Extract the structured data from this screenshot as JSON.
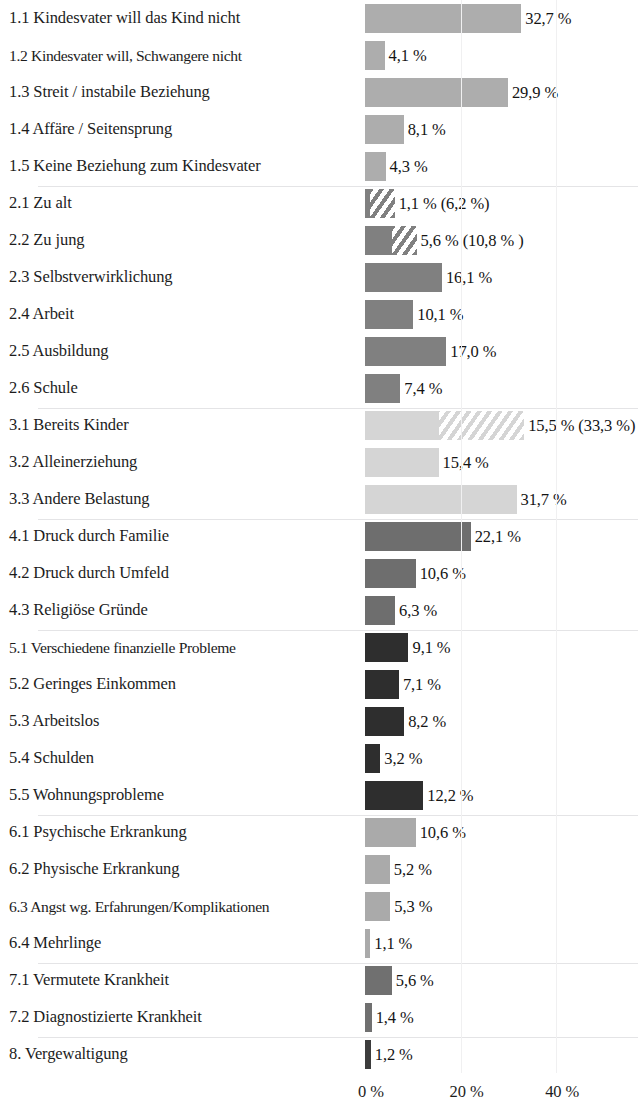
{
  "chart_data": {
    "type": "bar",
    "orientation": "horizontal",
    "title": "",
    "subtitle": "",
    "xlabel": "",
    "ylabel": "",
    "xlim": [
      0,
      45
    ],
    "grid": false,
    "legend": null,
    "xticks": [
      "0 %",
      "20 %",
      "40 %"
    ],
    "xtick_values": [
      0,
      20,
      40
    ],
    "value_separator": ",",
    "unit": "%",
    "note_parenthetical_meaning": "hatched extension / value in parentheses",
    "groups": [
      {
        "id": "1",
        "color": "#adadad",
        "items": [
          {
            "label": "1.1 Kindesvater will das Kind nicht",
            "value": 32.7,
            "value_label": "32,7 %",
            "hatch_value": null,
            "hatch_label": null
          },
          {
            "label": "1.2 Kindesvater will, Schwangere nicht",
            "value": 4.1,
            "value_label": "4,1 %",
            "hatch_value": null,
            "hatch_label": null
          },
          {
            "label": "1.3 Streit / instabile Beziehung",
            "value": 29.9,
            "value_label": "29,9 %",
            "hatch_value": null,
            "hatch_label": null
          },
          {
            "label": "1.4 Affäre / Seitensprung",
            "value": 8.1,
            "value_label": "8,1 %",
            "hatch_value": null,
            "hatch_label": null
          },
          {
            "label": "1.5 Keine Beziehung zum Kindesvater",
            "value": 4.3,
            "value_label": "4,3 %",
            "hatch_value": null,
            "hatch_label": null
          }
        ]
      },
      {
        "id": "2",
        "color": "#808080",
        "items": [
          {
            "label": "2.1 Zu alt",
            "value": 1.1,
            "value_label": "1,1 % (6,2 %)",
            "hatch_value": 6.2,
            "hatch_label": "6,2 %"
          },
          {
            "label": "2.2 Zu jung",
            "value": 5.6,
            "value_label": "5,6 % (10,8 % )",
            "hatch_value": 10.8,
            "hatch_label": "10,8 %"
          },
          {
            "label": "2.3 Selbstverwirklichung",
            "value": 16.1,
            "value_label": "16,1 %",
            "hatch_value": null,
            "hatch_label": null
          },
          {
            "label": "2.4 Arbeit",
            "value": 10.1,
            "value_label": "10,1 %",
            "hatch_value": null,
            "hatch_label": null
          },
          {
            "label": "2.5 Ausbildung",
            "value": 17.0,
            "value_label": "17,0 %",
            "hatch_value": null,
            "hatch_label": null
          },
          {
            "label": "2.6 Schule",
            "value": 7.4,
            "value_label": "7,4 %",
            "hatch_value": null,
            "hatch_label": null
          }
        ]
      },
      {
        "id": "3",
        "color": "#d5d5d5",
        "items": [
          {
            "label": "3.1 Bereits Kinder",
            "value": 15.5,
            "value_label": "15,5 % (33,3 %)",
            "hatch_value": 33.3,
            "hatch_label": "33,3 %"
          },
          {
            "label": "3.2 Alleinerziehung",
            "value": 15.4,
            "value_label": "15,4 %",
            "hatch_value": null,
            "hatch_label": null
          },
          {
            "label": "3.3 Andere Belastung",
            "value": 31.7,
            "value_label": "31,7 %",
            "hatch_value": null,
            "hatch_label": null
          }
        ]
      },
      {
        "id": "4",
        "color": "#6e6e6e",
        "items": [
          {
            "label": "4.1 Druck durch Familie",
            "value": 22.1,
            "value_label": "22,1 %",
            "hatch_value": null,
            "hatch_label": null
          },
          {
            "label": "4.2 Druck durch Umfeld",
            "value": 10.6,
            "value_label": "10,6 %",
            "hatch_value": null,
            "hatch_label": null
          },
          {
            "label": "4.3 Religiöse Gründe",
            "value": 6.3,
            "value_label": "6,3 %",
            "hatch_value": null,
            "hatch_label": null
          }
        ]
      },
      {
        "id": "5",
        "color": "#2e2e2e",
        "items": [
          {
            "label": "5.1 Verschiedene finanzielle Probleme",
            "value": 9.1,
            "value_label": "9,1 %",
            "hatch_value": null,
            "hatch_label": null
          },
          {
            "label": "5.2 Geringes Einkommen",
            "value": 7.1,
            "value_label": "7,1 %",
            "hatch_value": null,
            "hatch_label": null
          },
          {
            "label": "5.3 Arbeitslos",
            "value": 8.2,
            "value_label": "8,2 %",
            "hatch_value": null,
            "hatch_label": null
          },
          {
            "label": "5.4 Schulden",
            "value": 3.2,
            "value_label": "3,2 %",
            "hatch_value": null,
            "hatch_label": null
          },
          {
            "label": "5.5 Wohnungsprobleme",
            "value": 12.2,
            "value_label": "12,2 %",
            "hatch_value": null,
            "hatch_label": null
          }
        ]
      },
      {
        "id": "6",
        "color": "#aaaaaa",
        "items": [
          {
            "label": "6.1 Psychische Erkrankung",
            "value": 10.6,
            "value_label": "10,6 %",
            "hatch_value": null,
            "hatch_label": null
          },
          {
            "label": "6.2 Physische Erkrankung",
            "value": 5.2,
            "value_label": "5,2 %",
            "hatch_value": null,
            "hatch_label": null
          },
          {
            "label": "6.3 Angst wg. Erfahrungen/Komplikationen",
            "value": 5.3,
            "value_label": "5,3 %",
            "hatch_value": null,
            "hatch_label": null
          },
          {
            "label": "6.4 Mehrlinge",
            "value": 1.1,
            "value_label": "1,1 %",
            "hatch_value": null,
            "hatch_label": null
          }
        ]
      },
      {
        "id": "7",
        "color": "#707070",
        "items": [
          {
            "label": "7.1 Vermutete Krankheit",
            "value": 5.6,
            "value_label": "5,6 %",
            "hatch_value": null,
            "hatch_label": null
          },
          {
            "label": "7.2 Diagnostizierte Krankheit",
            "value": 1.4,
            "value_label": "1,4 %",
            "hatch_value": null,
            "hatch_label": null
          }
        ]
      },
      {
        "id": "8",
        "color": "#3c3c3c",
        "items": [
          {
            "label": "8. Vergewaltigung",
            "value": 1.2,
            "value_label": "1,2 %",
            "hatch_value": null,
            "hatch_label": null
          }
        ]
      }
    ]
  }
}
